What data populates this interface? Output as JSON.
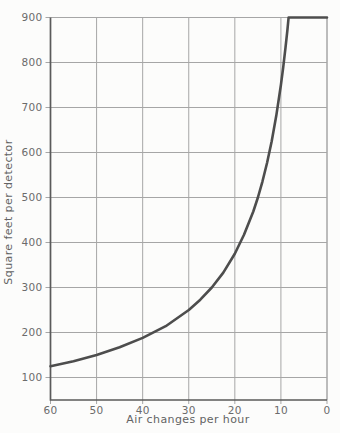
{
  "chart_data": {
    "type": "line",
    "title": "",
    "xlabel": "Air changes per hour",
    "ylabel": "Square feet per detector",
    "xlim": [
      60,
      0
    ],
    "ylim": [
      50,
      900
    ],
    "x_axis_reversed": true,
    "x_ticks": [
      60,
      50,
      40,
      30,
      20,
      10,
      0
    ],
    "y_ticks": [
      100,
      200,
      300,
      400,
      500,
      600,
      700,
      800,
      900
    ],
    "grid": true,
    "legend": false,
    "series": [
      {
        "name": "smoke-detector-spacing",
        "relationship": "spacing = 7500 / air_changes_per_hour, capped at 900",
        "color": "#4d4d4d",
        "line_width": 2.6,
        "points": [
          [
            60,
            125
          ],
          [
            55,
            136
          ],
          [
            50,
            150
          ],
          [
            45,
            167
          ],
          [
            40,
            188
          ],
          [
            35,
            214
          ],
          [
            30,
            250
          ],
          [
            27.5,
            273
          ],
          [
            25,
            300
          ],
          [
            22.5,
            333
          ],
          [
            20,
            375
          ],
          [
            18,
            417
          ],
          [
            16,
            469
          ],
          [
            15,
            500
          ],
          [
            14,
            536
          ],
          [
            13,
            577
          ],
          [
            12,
            625
          ],
          [
            11,
            682
          ],
          [
            10,
            750
          ],
          [
            9.5,
            789
          ],
          [
            9,
            833
          ],
          [
            8.6,
            872
          ],
          [
            8.33,
            900
          ],
          [
            0,
            900
          ]
        ]
      }
    ],
    "colors": {
      "grid": "#a6a6a6",
      "axis": "#5a5a5a",
      "label": "#6b6b6b",
      "background": "#fcfcfb"
    }
  }
}
